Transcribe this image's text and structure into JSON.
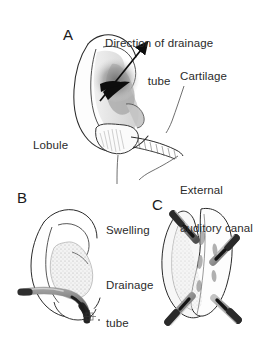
{
  "figure": {
    "background_color": "#ffffff",
    "ink_color": "#1a1a1a",
    "label_color": "#2b2b2b",
    "shade_color": "#9a9a9a",
    "tube_color": "#8d8d8d",
    "panels": [
      {
        "id": "A",
        "letter": "A",
        "caption": "Lateral view of auricle with hematoma and direction of drainage tube"
      },
      {
        "id": "B",
        "letter": "B",
        "caption": "Auricle with swelling and single drainage tube in place"
      },
      {
        "id": "C",
        "letter": "C",
        "caption": "Close-up of auricle with four drainage tubes"
      }
    ],
    "labels": [
      {
        "name": "direction-of-drainage-tube",
        "text": "Direction of drainage\ntube",
        "line1": "Direction of drainage",
        "line2": "tube"
      },
      {
        "name": "cartilage",
        "text": "Cartilage"
      },
      {
        "name": "lobule",
        "text": "Lobule"
      },
      {
        "name": "external-auditory-canal",
        "text": "External\nauditory canal",
        "line1": "External",
        "line2": "auditory canal"
      },
      {
        "name": "swelling",
        "text": "Swelling"
      },
      {
        "name": "drainage-tube",
        "text": "Drainage\ntube",
        "line1": "Drainage",
        "line2": "tube"
      }
    ]
  }
}
